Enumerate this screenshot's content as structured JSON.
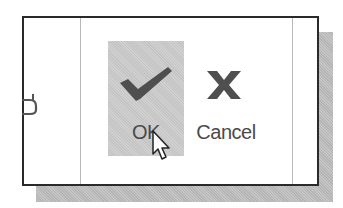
{
  "dialog": {
    "buttons": [
      {
        "id": "ok",
        "label": "OK",
        "icon": "checkmark-icon",
        "state": "hovered"
      },
      {
        "id": "cancel",
        "label": "Cancel",
        "icon": "x-close-icon",
        "state": "normal"
      }
    ]
  },
  "colors": {
    "icon": "#4f4f4f",
    "label": "#4a4a4a",
    "hover_bg": "#cacaca",
    "border": "#2a2a2a",
    "shadow": "#bdbdbd"
  },
  "cursor": {
    "type": "arrow-pointer",
    "over": "ok"
  }
}
